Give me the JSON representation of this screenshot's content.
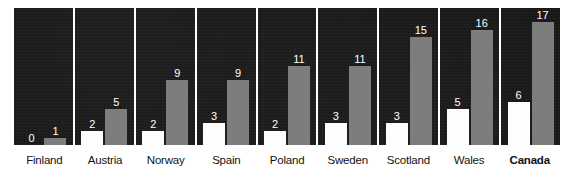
{
  "chart_data": {
    "type": "bar",
    "title": "",
    "subtitle": "",
    "xlabel": "",
    "ylabel": "",
    "ylim": [
      0,
      19
    ],
    "grid": false,
    "legend_position": "none",
    "orientation": "vertical",
    "categories": [
      "Finland",
      "Austria",
      "Norway",
      "Spain",
      "Poland",
      "Sweden",
      "Scotland",
      "Wales",
      "Canada"
    ],
    "series": [
      {
        "name": "series-1",
        "color": "#fdfdfd",
        "values": [
          0,
          2,
          2,
          3,
          2,
          3,
          3,
          5,
          6
        ]
      },
      {
        "name": "series-2",
        "color": "#7d7d7d",
        "values": [
          1,
          5,
          9,
          9,
          11,
          11,
          15,
          16,
          17
        ]
      }
    ],
    "background_color": "#171717",
    "label_color": "#ffffff",
    "axis_label_color": "#121212",
    "emphasized_category": "Canada",
    "data_labels": {
      "Finland": {
        "series-1": "0",
        "series-2": "1"
      },
      "Austria": {
        "series-1": "2",
        "series-2": "5"
      },
      "Norway": {
        "series-1": "2",
        "series-2": "9"
      },
      "Spain": {
        "series-1": "3",
        "series-2": "9"
      },
      "Poland": {
        "series-1": "2",
        "series-2": "11"
      },
      "Sweden": {
        "series-1": "3",
        "series-2": "11"
      },
      "Scotland": {
        "series-1": "3",
        "series-2": "15"
      },
      "Wales": {
        "series-1": "5",
        "series-2": "16"
      },
      "Canada": {
        "series-1": "6",
        "series-2": "17"
      }
    }
  },
  "panels": [
    {
      "category": "Finland",
      "bold": false,
      "left_value": "0",
      "right_value": "1"
    },
    {
      "category": "Austria",
      "bold": false,
      "left_value": "2",
      "right_value": "5"
    },
    {
      "category": "Norway",
      "bold": false,
      "left_value": "2",
      "right_value": "9"
    },
    {
      "category": "Spain",
      "bold": false,
      "left_value": "3",
      "right_value": "9"
    },
    {
      "category": "Poland",
      "bold": false,
      "left_value": "2",
      "right_value": "11"
    },
    {
      "category": "Sweden",
      "bold": false,
      "left_value": "3",
      "right_value": "11"
    },
    {
      "category": "Scotland",
      "bold": false,
      "left_value": "3",
      "right_value": "15"
    },
    {
      "category": "Wales",
      "bold": false,
      "left_value": "5",
      "right_value": "16"
    },
    {
      "category": "Canada",
      "bold": true,
      "left_value": "6",
      "right_value": "17"
    }
  ]
}
